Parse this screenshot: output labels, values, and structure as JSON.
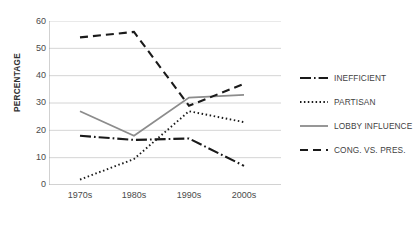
{
  "chart_data": {
    "type": "line",
    "title": "",
    "xlabel": "",
    "ylabel": "PERCENTAGE",
    "categories": [
      "1970s",
      "1980s",
      "1990s",
      "2000s"
    ],
    "ylim": [
      0,
      60
    ],
    "yticks": [
      0,
      10,
      20,
      30,
      40,
      50,
      60
    ],
    "grid": true,
    "legend_position": "right",
    "series": [
      {
        "name": "INEFFICIENT",
        "values": [
          18,
          16.5,
          17,
          7
        ],
        "style": "dash-dot",
        "color": "#1a1a1a"
      },
      {
        "name": "PARTISAN",
        "values": [
          2,
          9.5,
          27,
          23
        ],
        "style": "dotted",
        "color": "#1a1a1a"
      },
      {
        "name": "LOBBY INFLUENCE",
        "values": [
          27,
          18,
          32,
          33
        ],
        "style": "solid",
        "color": "#8c8c8c"
      },
      {
        "name": "CONG. VS. PRES.",
        "values": [
          54,
          56,
          29,
          37
        ],
        "style": "dashed",
        "color": "#1a1a1a"
      }
    ]
  },
  "axis": {
    "y_title": "PERCENTAGE",
    "y_tick_labels": [
      "60",
      "50",
      "40",
      "30",
      "20",
      "10",
      "0"
    ],
    "x_tick_labels": [
      "1970s",
      "1980s",
      "1990s",
      "2000s"
    ]
  },
  "legend": {
    "items": [
      {
        "label": "INEFFICIENT"
      },
      {
        "label": "PARTISAN"
      },
      {
        "label": "LOBBY INFLUENCE"
      },
      {
        "label": "CONG. VS. PRES."
      }
    ]
  },
  "colors": {
    "gray_series": "#8c8c8c",
    "black_series": "#1a1a1a",
    "gridline": "#c9c9c9",
    "text": "#3f3f3f"
  }
}
